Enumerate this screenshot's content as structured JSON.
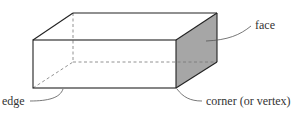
{
  "diagram": {
    "labels": {
      "face": "face",
      "edge": "edge",
      "corner": "corner (or vertex)"
    },
    "colors": {
      "stroke": "#222222",
      "face_fill": "#a6a6a6",
      "hidden_edge": "#777777",
      "leader": "#555555"
    }
  }
}
